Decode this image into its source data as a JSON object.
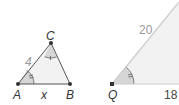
{
  "diagram": {
    "triangle_abc": {
      "vertices": {
        "A": "A",
        "B": "B",
        "C": "C"
      },
      "side_ac": "4",
      "side_ab": "x",
      "angle_a_marks": 2,
      "angle_c_marks": 1
    },
    "triangle_q": {
      "vertex": "Q",
      "side_slanted": "20",
      "side_base": "18",
      "angle_q_marks": 2
    },
    "colors": {
      "fill": "#f2f2f2",
      "angle_fill": "#d9d9d9",
      "line": "#555555",
      "light_line": "#cccccc",
      "vertex_dot": "#333333"
    }
  }
}
